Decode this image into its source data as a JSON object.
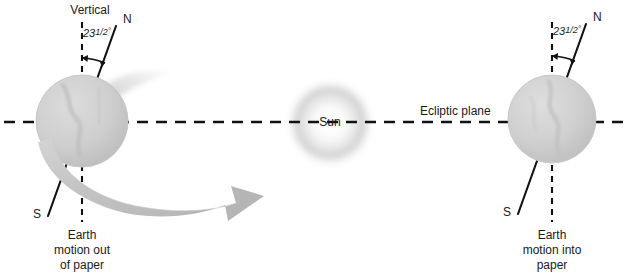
{
  "diagram": {
    "background_color": "#ffffff",
    "ink_color": "#1a1a1a",
    "globe_color": "#c9c9c9",
    "arrow_color": "#bdbdbd",
    "sun_color": "#b3b3b3",
    "width": 635,
    "height": 275
  },
  "ecliptic": {
    "label": "Ecliptic plane",
    "line_style": "dashed",
    "y": 122
  },
  "sun": {
    "label": "Sun",
    "center_x": 330,
    "center_y": 123,
    "radius": 45
  },
  "left_earth": {
    "vertical_label": "Vertical",
    "north_pole_label": "N",
    "south_pole_label": "S",
    "tilt_angle": "23",
    "tilt_fraction": "1/2",
    "tilt_degree_symbol": "°",
    "tilt_value_full": "23 1/2°",
    "motion_label_line1": "Earth",
    "motion_label_line2": "motion out",
    "motion_label_line3": "of paper",
    "center_x": 82,
    "center_y": 121,
    "radius": 46
  },
  "right_earth": {
    "north_pole_label": "N",
    "south_pole_label": "S",
    "tilt_angle": "23",
    "tilt_fraction": "1/2",
    "tilt_degree_symbol": "°",
    "tilt_value_full": "23 1/2°",
    "motion_label_line1": "Earth",
    "motion_label_line2": "motion into",
    "motion_label_line3": "paper",
    "center_x": 552,
    "center_y": 119,
    "radius": 44
  },
  "orbit_arrow": {
    "name": "orbital-motion-arrow",
    "description": "curved block arrow sweeping from behind left Earth toward the Sun"
  }
}
